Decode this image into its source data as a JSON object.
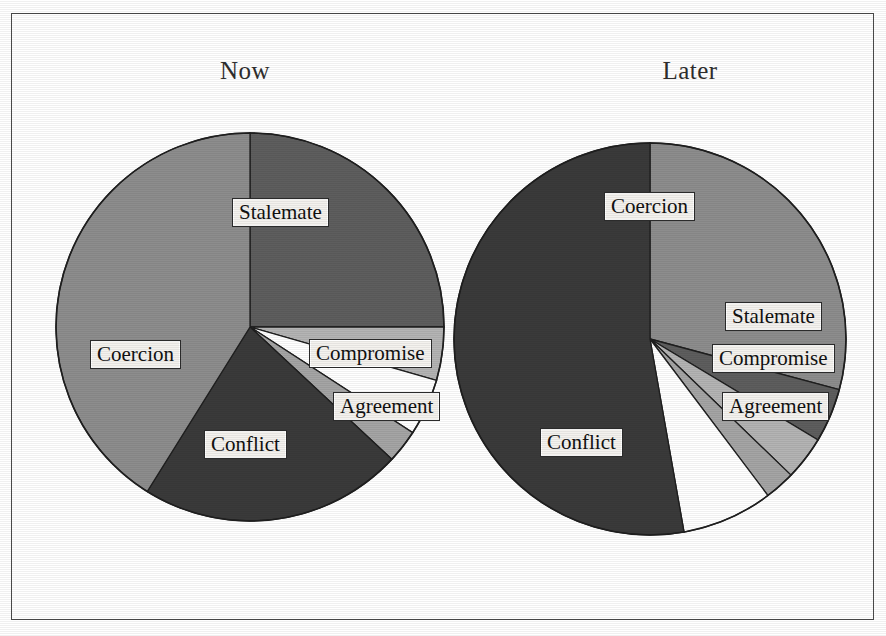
{
  "figure": {
    "background": "#ffffff",
    "frame_color": "#4a4a4a"
  },
  "chart_data": [
    {
      "type": "pie",
      "title": "Now",
      "categories": [
        "Stalemate",
        "Compromise",
        "Agreement",
        "Conflict",
        "Coercion"
      ],
      "values": [
        25,
        4.5,
        5,
        22,
        41
      ],
      "colors": [
        "#5e5e5e",
        "#b4b4b4",
        "#ffffff",
        "#3a3a3a",
        "#8d8d8d"
      ],
      "start_angle": 0,
      "direction": "clockwise",
      "legend": "none",
      "labels_inside": true
    },
    {
      "type": "pie",
      "title": "Later",
      "categories": [
        "Coercion",
        "Stalemate",
        "Compromise",
        "Agreement",
        "Conflict"
      ],
      "values": [
        29,
        4.5,
        6,
        7.5,
        53
      ],
      "colors": [
        "#8d8d8d",
        "#5e5e5e",
        "#b4b4b4",
        "#ffffff",
        "#3a3a3a"
      ],
      "start_angle": 0,
      "direction": "clockwise",
      "legend": "none",
      "labels_inside": true
    }
  ],
  "pie_now": {
    "title": "Now",
    "center": {
      "x": 250,
      "y": 327
    },
    "radius": 194,
    "slices": [
      {
        "name": "Stalemate",
        "start": 0,
        "end": 90,
        "fill": "#5e5e5e"
      },
      {
        "name": "Compromise",
        "start": 90,
        "end": 106,
        "fill": "#b4b4b4"
      },
      {
        "name": "Agreement",
        "start": 106,
        "end": 123,
        "fill": "#ffffff"
      },
      {
        "name": "Wedge",
        "start": 123,
        "end": 133,
        "fill": "#a5a5a5"
      },
      {
        "name": "Conflict",
        "start": 133,
        "end": 212,
        "fill": "#3a3a3a"
      },
      {
        "name": "Coercion",
        "start": 212,
        "end": 360,
        "fill": "#8d8d8d"
      }
    ],
    "labels": [
      {
        "text": "Stalemate",
        "left": 232,
        "top": 198
      },
      {
        "text": "Compromise",
        "left": 309,
        "top": 339
      },
      {
        "text": "Agreement",
        "left": 333,
        "top": 392
      },
      {
        "text": "Coercion",
        "left": 90,
        "top": 340
      },
      {
        "text": "Conflict",
        "left": 204,
        "top": 430
      }
    ]
  },
  "pie_later": {
    "title": "Later",
    "center": {
      "x": 650,
      "y": 339
    },
    "radius": 196,
    "slices": [
      {
        "name": "Coercion",
        "start": 0,
        "end": 105,
        "fill": "#8d8d8d"
      },
      {
        "name": "Stalemate",
        "start": 105,
        "end": 121,
        "fill": "#5e5e5e"
      },
      {
        "name": "Compromise",
        "start": 121,
        "end": 134,
        "fill": "#b4b4b4"
      },
      {
        "name": "Wedge",
        "start": 134,
        "end": 143,
        "fill": "#a5a5a5"
      },
      {
        "name": "Agreement",
        "start": 143,
        "end": 170,
        "fill": "#ffffff"
      },
      {
        "name": "Conflict",
        "start": 170,
        "end": 360,
        "fill": "#3a3a3a"
      }
    ],
    "labels": [
      {
        "text": "Coercion",
        "left": 604,
        "top": 192
      },
      {
        "text": "Stalemate",
        "left": 725,
        "top": 302
      },
      {
        "text": "Compromise",
        "left": 712,
        "top": 344
      },
      {
        "text": "Agreement",
        "left": 722,
        "top": 392
      },
      {
        "text": "Conflict",
        "left": 540,
        "top": 428
      }
    ]
  }
}
